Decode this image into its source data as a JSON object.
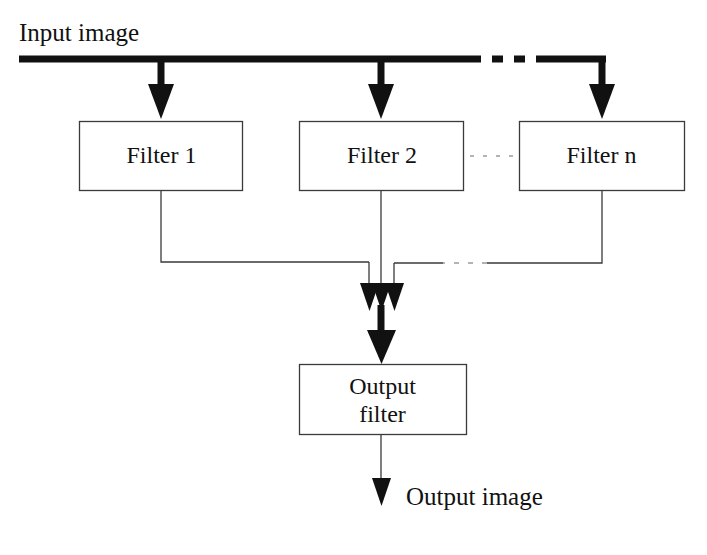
{
  "diagram": {
    "colors": {
      "stroke": "#111111",
      "thin_stroke": "#3a3a3a",
      "background": "#ffffff"
    },
    "input": {
      "label": "Input image",
      "bus_line": "thick-horizontal-bus",
      "bus_dash_note": "dashed gap before last branch"
    },
    "filters": [
      {
        "id": "filter-1",
        "label": "Filter 1"
      },
      {
        "id": "filter-2",
        "label": "Filter 2"
      },
      {
        "id": "filter-n",
        "label": "Filter n"
      }
    ],
    "ellipsis_between_filters": "dotted",
    "output_filter": {
      "label_line_1": "Output",
      "label_line_2": "filter"
    },
    "output": {
      "label": "Output image"
    },
    "arrows": {
      "input_branch_count": 3,
      "converging_count": 3,
      "output_arrow": "thin-down-arrow"
    }
  }
}
